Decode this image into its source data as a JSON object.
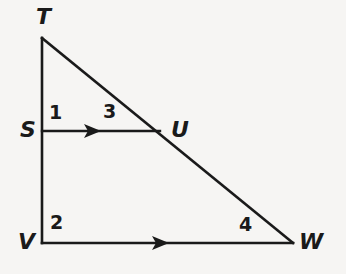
{
  "figure": {
    "type": "geometry-diagram",
    "background_color": "#f6f5f3",
    "stroke_color": "#1a1a1a",
    "stroke_width": 2.4
  },
  "points": {
    "T": {
      "label": "T",
      "x": 42,
      "y": 38
    },
    "S": {
      "label": "S",
      "x": 42,
      "y": 131
    },
    "U": {
      "label": "U",
      "x": 158,
      "y": 131
    },
    "V": {
      "label": "V",
      "x": 42,
      "y": 243
    },
    "W": {
      "label": "W",
      "x": 293,
      "y": 243
    }
  },
  "segments": [
    {
      "name": "TV",
      "from": "T",
      "to": "V",
      "arrow": false
    },
    {
      "name": "TW",
      "from": "T",
      "to": "W",
      "arrow": false
    },
    {
      "name": "VW",
      "from": "V",
      "to": "W",
      "arrow": true
    },
    {
      "name": "SU",
      "from": "S",
      "to": "U",
      "arrow": true
    }
  ],
  "angle_labels": [
    {
      "name": "angle-1",
      "label": "1",
      "at_vertex": "S",
      "x": 49,
      "y": 103
    },
    {
      "name": "angle-3",
      "label": "3",
      "at_vertex": "U",
      "x": 103,
      "y": 102
    },
    {
      "name": "angle-2",
      "label": "2",
      "at_vertex": "V",
      "x": 50,
      "y": 213
    },
    {
      "name": "angle-4",
      "label": "4",
      "at_vertex": "W",
      "x": 239,
      "y": 215
    }
  ],
  "arrow_marks": [
    {
      "name": "su-arrow",
      "on_segment": "SU",
      "x": 96,
      "y": 131
    },
    {
      "name": "vw-arrow",
      "on_segment": "VW",
      "x": 164,
      "y": 243
    }
  ]
}
